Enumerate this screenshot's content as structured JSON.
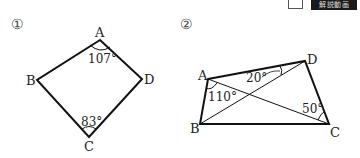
{
  "toolbar": {
    "checkbox_state": "unchecked",
    "video_button_label": "解説動画"
  },
  "problems": [
    {
      "number": "①",
      "vertices": {
        "A": "A",
        "B": "B",
        "C": "C",
        "D": "D"
      },
      "angles": {
        "A": "107°",
        "C": "83°"
      }
    },
    {
      "number": "②",
      "vertices": {
        "A": "A",
        "B": "B",
        "C": "C",
        "D": "D"
      },
      "angles": {
        "BAC": "110°",
        "ADB": "20°",
        "ACD": "50°"
      }
    }
  ]
}
